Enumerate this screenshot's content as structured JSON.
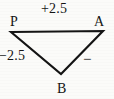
{
  "figure": {
    "type": "geometry-diagram",
    "background_color": "#fbfbf9",
    "stroke_color": "#141414",
    "width": 114,
    "height": 99,
    "shape": "triangle",
    "vertices": [
      {
        "name": "P",
        "label": "P",
        "x": 11,
        "y": 32,
        "label_x": 10,
        "label_y": 15
      },
      {
        "name": "A",
        "label": "A",
        "x": 103,
        "y": 31,
        "label_x": 94,
        "label_y": 15
      },
      {
        "name": "B",
        "label": "B",
        "x": 61,
        "y": 74,
        "label_x": 57,
        "label_y": 82
      }
    ],
    "edges": [
      {
        "name": "PA",
        "from": "P",
        "to": "A",
        "label": "+2.5",
        "label_position": "top"
      },
      {
        "name": "PB",
        "from": "P",
        "to": "B",
        "label": "−2.5",
        "label_position": "left"
      },
      {
        "name": "AB",
        "from": "A",
        "to": "B",
        "label": "−",
        "label_position": "right"
      }
    ],
    "labels": {
      "vertex_p": "P",
      "vertex_a": "A",
      "vertex_b": "B",
      "top_value": "+2.5",
      "left_value": "−2.5",
      "right_value": "−"
    }
  }
}
